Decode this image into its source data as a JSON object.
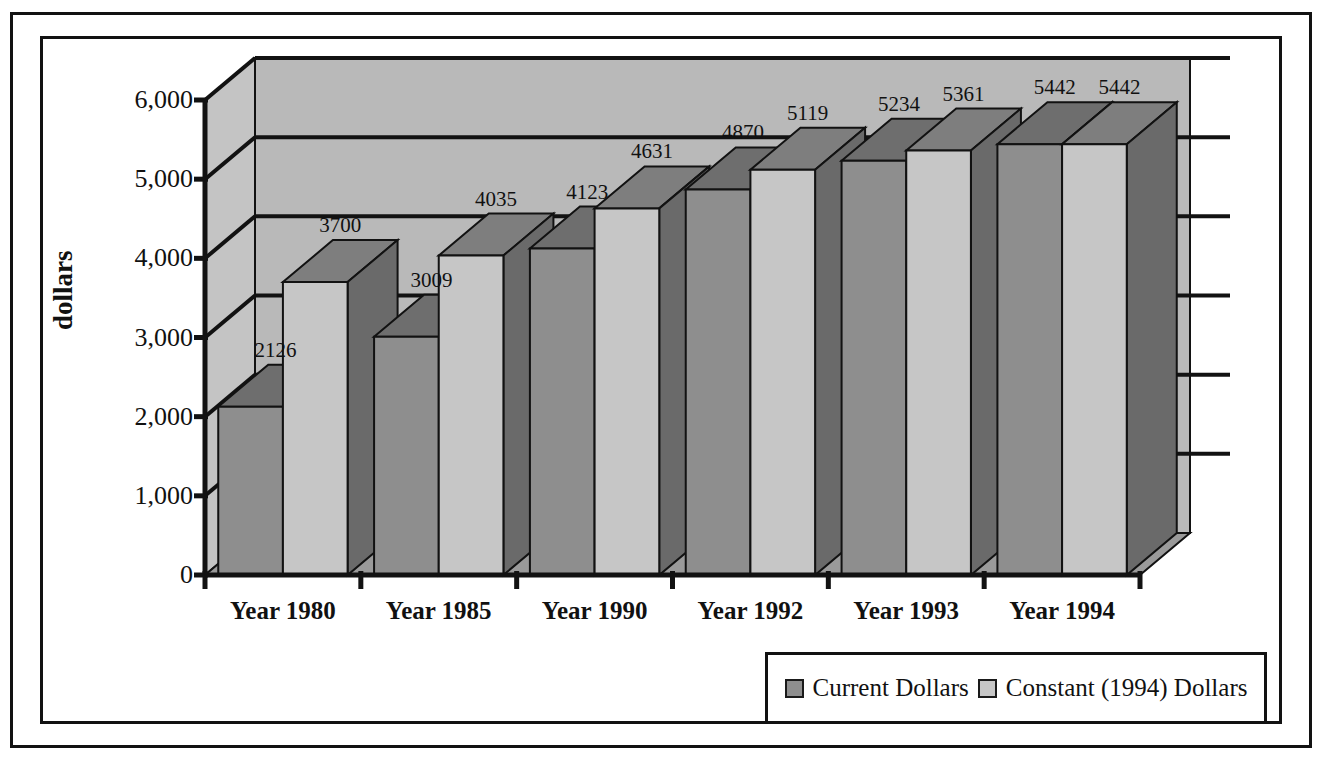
{
  "chart_data": {
    "type": "bar",
    "title": "",
    "subtitle": "",
    "xlabel": "",
    "ylabel": "dollars",
    "ylim": [
      0,
      6000
    ],
    "ytick_values": [
      0,
      1000,
      2000,
      3000,
      4000,
      5000,
      6000
    ],
    "ytick_labels": [
      "0",
      "1,000",
      "2,000",
      "3,000",
      "4,000",
      "5,000",
      "6,000"
    ],
    "grid": true,
    "legend_position": "bottom-right",
    "three_d": true,
    "categories": [
      "Year 1980",
      "Year 1985",
      "Year 1990",
      "Year 1992",
      "Year 1993",
      "Year 1994"
    ],
    "series": [
      {
        "name": "Current Dollars",
        "color": "#8e8e8e",
        "values": [
          2126,
          3009,
          4123,
          4870,
          5234,
          5442
        ],
        "labels": [
          "2126",
          "3009",
          "4123",
          "4870",
          "5234",
          "5442"
        ]
      },
      {
        "name": "Constant (1994) Dollars",
        "color": "#c6c6c6",
        "values": [
          3700,
          4035,
          4631,
          5119,
          5361,
          5442
        ],
        "labels": [
          "3700",
          "4035",
          "4631",
          "5119",
          "5361",
          "5442"
        ]
      }
    ]
  },
  "legend": {
    "entries": [
      {
        "label": "Current Dollars",
        "swatch_color": "#8e8e8e"
      },
      {
        "label": "Constant (1994) Dollars",
        "swatch_color": "#c6c6c6"
      }
    ]
  },
  "colors": {
    "frame": "#121212",
    "wall_back": "#b9b9b9",
    "wall_left": "#c4c4c4",
    "floor": "#9a9a9a",
    "bar_current_front": "#8e8e8e",
    "bar_current_side": "#5d5d5d",
    "bar_current_top": "#6e6e6e",
    "bar_constant_front": "#c6c6c6",
    "bar_constant_side": "#6a6a6a",
    "bar_constant_top": "#7e7e7e",
    "axis": "#121212",
    "text": "#111111"
  }
}
